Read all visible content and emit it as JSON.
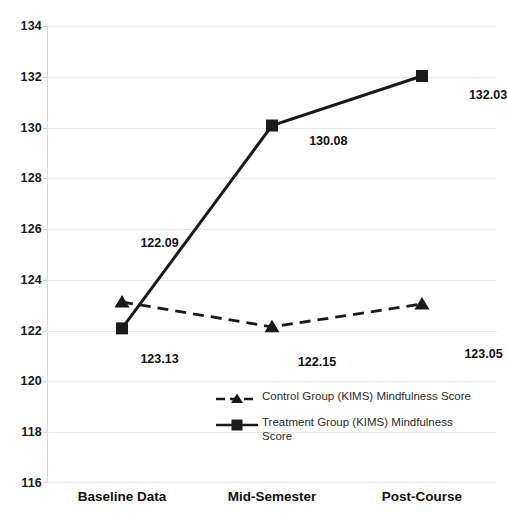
{
  "chart_data": {
    "type": "line",
    "title": "",
    "xlabel": "",
    "ylabel": "",
    "categories": [
      "Baseline Data",
      "Mid-Semester",
      "Post-Course"
    ],
    "ylim": [
      116,
      134
    ],
    "ytick_step": 2,
    "yticks": [
      134,
      132,
      130,
      128,
      126,
      124,
      122,
      120,
      118,
      116
    ],
    "grid": true,
    "legend_position": "inside-bottom-center",
    "series": [
      {
        "name": "Control Group (KIMS) Mindfulness Score",
        "marker": "triangle",
        "linestyle": "dashed",
        "color": "#1a1a1a",
        "values": [
          123.13,
          122.15,
          123.05
        ],
        "data_labels": [
          "123.13",
          "122.15",
          "123.05"
        ]
      },
      {
        "name": "Treatment Group (KIMS) Mindfulness Score",
        "marker": "square",
        "linestyle": "solid",
        "color": "#1a1a1a",
        "values": [
          122.09,
          130.08,
          132.03
        ],
        "data_labels": [
          "122.09",
          "130.08",
          "132.03"
        ]
      }
    ]
  },
  "axes": {
    "ytick_labels": [
      "134",
      "132",
      "130",
      "128",
      "126",
      "124",
      "122",
      "120",
      "118",
      "116"
    ],
    "xtick_labels": [
      "Baseline Data",
      "Mid-Semester",
      "Post-Course"
    ]
  },
  "annotations": {
    "labels": [
      {
        "text": "122.09",
        "x_pct": 25.0,
        "y_px": 243
      },
      {
        "text": "123.13",
        "x_pct": 25.0,
        "y_px": 359
      },
      {
        "text": "130.08",
        "x_pct": 62.5,
        "y_px": 141
      },
      {
        "text": "122.15",
        "x_pct": 60.0,
        "y_px": 362
      },
      {
        "text": "123.05",
        "x_pct": 97.0,
        "y_px": 354
      },
      {
        "text": "132.03",
        "x_pct": 98.0,
        "y_px": 95
      }
    ]
  },
  "legend": {
    "entries": [
      {
        "label": "Control Group (KIMS) Mindfulness Score",
        "marker": "triangle-icon",
        "dash": true
      },
      {
        "label": "Treatment Group (KIMS) Mindfulness Score",
        "marker": "square-icon",
        "dash": false
      }
    ]
  },
  "colors": {
    "series": "#1a1a1a",
    "gridline": "#e8e8e8",
    "text": "#111111",
    "background": "#ffffff"
  }
}
